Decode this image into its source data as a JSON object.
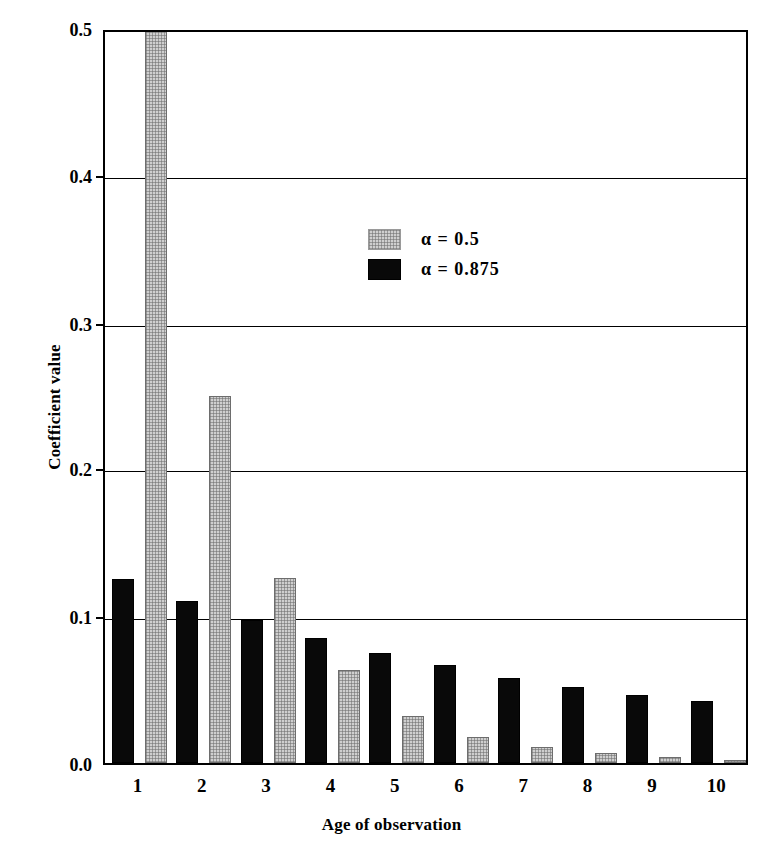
{
  "chart_data": {
    "type": "bar",
    "title": "",
    "xlabel": "Age of observation",
    "ylabel": "Coefficient value",
    "categories": [
      "1",
      "2",
      "3",
      "4",
      "5",
      "6",
      "7",
      "8",
      "9",
      "10"
    ],
    "series": [
      {
        "name": "α = 0.5",
        "color": "#cfcfcf",
        "values": [
          0.5,
          0.25,
          0.126,
          0.063,
          0.032,
          0.018,
          0.011,
          0.007,
          0.004,
          0.002
        ]
      },
      {
        "name": "α = 0.875",
        "color": "#090909",
        "values": [
          0.125,
          0.11,
          0.097,
          0.085,
          0.075,
          0.067,
          0.058,
          0.052,
          0.046,
          0.042
        ]
      }
    ],
    "ylim": [
      0.0,
      0.5
    ],
    "yticks": [
      "0.0",
      "0.1",
      "0.2",
      "0.3",
      "0.4",
      "0.5"
    ],
    "ytick_values": [
      0.0,
      0.1,
      0.2,
      0.3,
      0.4,
      0.5
    ],
    "grid": true,
    "legend_position": "upper-center"
  },
  "legend": {
    "entries": [
      {
        "label": "α = 0.5",
        "swatch": "gray"
      },
      {
        "label": "α = 0.875",
        "swatch": "black"
      }
    ]
  }
}
